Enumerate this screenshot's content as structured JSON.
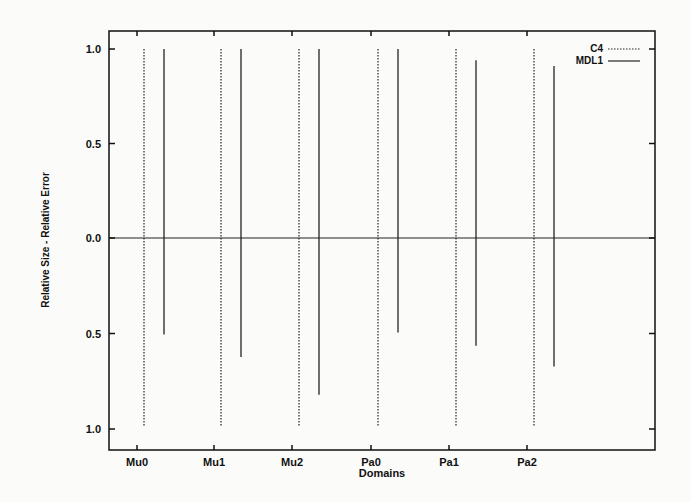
{
  "chart_data": {
    "type": "bar",
    "title": "",
    "xlabel": "Domains",
    "ylabel": "Relative Size - Relative Error",
    "categories": [
      "Mu0",
      "Mu1",
      "Mu2",
      "Pa0",
      "Pa1",
      "Pa2"
    ],
    "y_ticks_top": [
      "1.0",
      "0.5",
      "0.0"
    ],
    "y_ticks_bottom": [
      "0.5",
      "1.0"
    ],
    "ylim": [
      -1.0,
      1.0
    ],
    "legend_position": "top-right",
    "series": [
      {
        "name": "C4",
        "style": "dotted",
        "upper": [
          1.0,
          1.0,
          1.0,
          1.0,
          1.0,
          1.0
        ],
        "lower": [
          1.0,
          1.0,
          1.0,
          1.0,
          1.0,
          1.0
        ]
      },
      {
        "name": "MDL1",
        "style": "solid",
        "upper": [
          1.0,
          1.0,
          1.0,
          1.0,
          0.94,
          0.91
        ],
        "lower": [
          0.51,
          0.63,
          0.83,
          0.5,
          0.57,
          0.68
        ]
      }
    ]
  },
  "legend": {
    "c4": "C4",
    "mdl1": "MDL1"
  },
  "axes": {
    "xlabel": "Domains",
    "ylabel": "Relative Size - Relative Error"
  }
}
